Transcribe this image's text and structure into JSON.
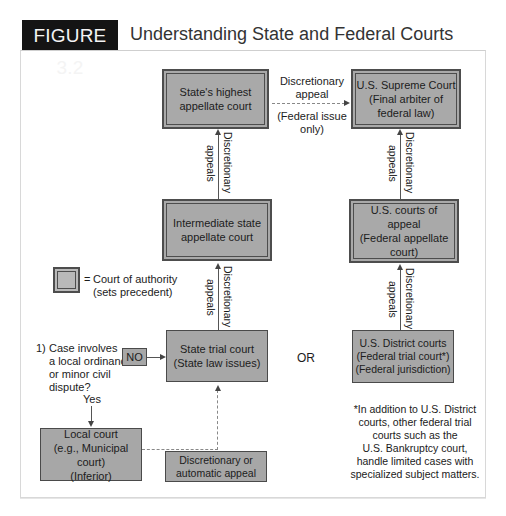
{
  "figure": {
    "tag": "FIGURE 3.2",
    "title": "Understanding State and Federal Courts"
  },
  "boxes": {
    "state_highest": "State's highest appellate court",
    "us_supreme": [
      "U.S. Supreme Court",
      "(Final arbiter of",
      "federal law)"
    ],
    "intermediate_state": [
      "Intermediate state",
      "appellate court"
    ],
    "us_appeals": [
      "U.S. courts of appeal",
      "(Federal appellate",
      "court)"
    ],
    "state_trial": [
      "State trial court",
      "(State law issues)"
    ],
    "us_district": [
      "U.S. District courts",
      "(Federal trial court*)",
      "(Federal jurisdiction)"
    ],
    "local_court": [
      "Local court",
      "(e.g., Municipal court)",
      "(Inferior)"
    ],
    "disc_auto": [
      "Discretionary or",
      "automatic appeal"
    ],
    "no": "NO"
  },
  "labels": {
    "discretionary": "Discretionary",
    "appeals": "appeals",
    "top_arrow_1": "Discretionary",
    "top_arrow_2": "appeal",
    "top_arrow_3": "(Federal issue",
    "top_arrow_4": "only)",
    "or": "OR",
    "yes": "Yes",
    "question_num": "1)",
    "question": [
      "Case involves",
      "a local ordinance",
      "or minor civil",
      "dispute?"
    ]
  },
  "legend": {
    "eq": "=",
    "line1": "Court of authority",
    "line2": "(sets precedent)"
  },
  "footnote": [
    "*In addition to U.S. District",
    "courts, other federal trial",
    "courts such as the",
    "U.S. Bankruptcy court,",
    "handle limited cases with",
    "specialized subject matters."
  ]
}
